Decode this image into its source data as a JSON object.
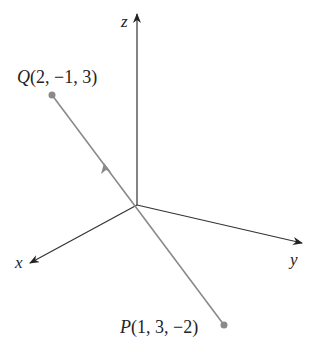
{
  "diagram": {
    "type": "3d-coordinate-axes-vector",
    "axes": {
      "x_label": "x",
      "y_label": "y",
      "z_label": "z"
    },
    "points": {
      "Q": {
        "name": "Q",
        "coords": "(2, −1, 3)"
      },
      "P": {
        "name": "P",
        "coords": "(1, 3, −2)"
      }
    },
    "vector": {
      "from": "P",
      "to": "Q",
      "direction_arrow": "toward Q"
    },
    "colors": {
      "axes": "#333333",
      "segment": "#8a8a8a",
      "point": "#8a8a8a",
      "text": "#222222"
    }
  }
}
